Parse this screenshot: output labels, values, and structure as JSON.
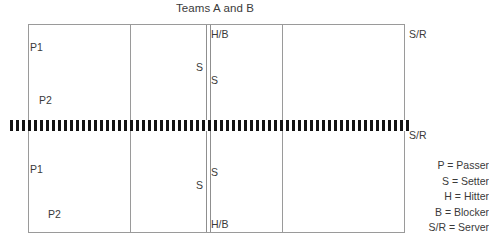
{
  "title": "Teams A and B",
  "court": {
    "top_half": {
      "passer_1": "P1",
      "passer_2": "P2",
      "setter_left": "S",
      "setter_right": "S",
      "hitter_blocker": "H/B",
      "server": "S/R"
    },
    "bottom_half": {
      "passer_1": "P1",
      "passer_2": "P2",
      "setter_left": "S",
      "setter_right": "S",
      "hitter_blocker": "H/B",
      "server": "S/R"
    }
  },
  "legend": {
    "rows": [
      {
        "label": "P = Passer"
      },
      {
        "label": "S = Setter"
      },
      {
        "label": "H = Hitter"
      },
      {
        "label": "B = Blocker"
      },
      {
        "label": "S/R = Server"
      }
    ]
  },
  "colors": {
    "court_line": "#9a9a9a",
    "net": "#121212",
    "text": "#3a3a3a",
    "background": "#ffffff"
  }
}
